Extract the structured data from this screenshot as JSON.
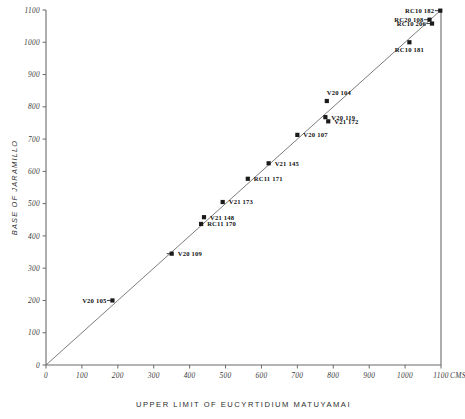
{
  "chart_data": {
    "type": "scatter",
    "title": "",
    "xlabel": "UPPER LIMIT OF EUCYRTIDIUM MATUYAMAI",
    "ylabel": "BASE OF JARAMILLO",
    "x_unit": "CMS",
    "xlim": [
      0,
      1100
    ],
    "ylim": [
      0,
      1100
    ],
    "xticks": [
      0,
      100,
      200,
      300,
      400,
      500,
      600,
      700,
      800,
      900,
      1000,
      1100
    ],
    "yticks": [
      0,
      100,
      200,
      300,
      400,
      500,
      600,
      700,
      800,
      900,
      1000,
      1100
    ],
    "xtick_labels": [
      "0",
      "100",
      "200",
      "300",
      "400",
      "500",
      "600",
      "700",
      "800",
      "900",
      "1000",
      "1100"
    ],
    "ytick_labels": [
      "0",
      "100",
      "200",
      "300",
      "400",
      "500",
      "600",
      "700",
      "800",
      "900",
      "1000",
      "1100"
    ],
    "grid": false,
    "legend": "none",
    "fit_line": {
      "type": "line",
      "x": [
        0,
        1100
      ],
      "y": [
        0,
        1100
      ]
    },
    "points": [
      {
        "label": "V20 105",
        "x": 185,
        "y": 200,
        "label_side": "left"
      },
      {
        "label": "V20 109",
        "x": 350,
        "y": 345,
        "label_side": "right"
      },
      {
        "label": "RC11 170",
        "x": 432,
        "y": 437,
        "label_side": "right"
      },
      {
        "label": "V21 148",
        "x": 440,
        "y": 458,
        "label_side": "right"
      },
      {
        "label": "V21 173",
        "x": 492,
        "y": 505,
        "label_side": "right"
      },
      {
        "label": "RC11 171",
        "x": 562,
        "y": 577,
        "label_side": "right"
      },
      {
        "label": "V21 145",
        "x": 620,
        "y": 625,
        "label_side": "right"
      },
      {
        "label": "V20 107",
        "x": 700,
        "y": 713,
        "label_side": "right"
      },
      {
        "label": "V20 119",
        "x": 778,
        "y": 768,
        "label_side": "right"
      },
      {
        "label": "V21 172",
        "x": 786,
        "y": 755,
        "label_side": "right"
      },
      {
        "label": "V20 104",
        "x": 782,
        "y": 818,
        "label_side": "above"
      },
      {
        "label": "RC10 181",
        "x": 1012,
        "y": 1000,
        "label_side": "below"
      },
      {
        "label": "RC10 206",
        "x": 1075,
        "y": 1058,
        "label_side": "left"
      },
      {
        "label": "RC20 108",
        "x": 1068,
        "y": 1070,
        "label_side": "left"
      },
      {
        "label": "RC10 182",
        "x": 1098,
        "y": 1098,
        "label_side": "left"
      }
    ]
  }
}
